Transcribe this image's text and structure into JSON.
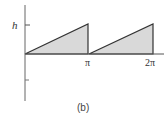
{
  "figure": {
    "caption": "(b)",
    "y_label": "h",
    "x_ticks": [
      "π",
      "2π"
    ],
    "fill_color": "#d9d9d9",
    "stroke_color": "#333333"
  },
  "waveform": {
    "type": "sawtooth",
    "amplitude_label": "h",
    "periods": [
      {
        "start": "0",
        "end": "π"
      },
      {
        "start": "π",
        "end": "2π"
      }
    ]
  }
}
